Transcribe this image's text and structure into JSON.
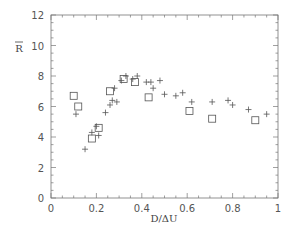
{
  "chart_data": {
    "type": "scatter",
    "title": "",
    "xlabel": "D/ΔU",
    "ylabel": "R̅",
    "xlim": [
      0,
      1
    ],
    "ylim": [
      0,
      12
    ],
    "xticks": [
      0,
      0.2,
      0.4,
      0.6,
      0.8,
      1
    ],
    "xtick_labels": [
      "0",
      "0.2",
      "0.4",
      "0.6",
      "0.8",
      "1"
    ],
    "yticks": [
      0,
      2,
      4,
      6,
      8,
      10,
      12
    ],
    "ytick_labels": [
      "0",
      "2",
      "4",
      "6",
      "8",
      "10",
      "12"
    ],
    "grid": false,
    "legend": null,
    "series": [
      {
        "name": "squares",
        "marker": "square",
        "points": [
          [
            0.1,
            6.7
          ],
          [
            0.12,
            6.0
          ],
          [
            0.18,
            3.9
          ],
          [
            0.21,
            4.6
          ],
          [
            0.26,
            7.0
          ],
          [
            0.32,
            7.8
          ],
          [
            0.37,
            7.6
          ],
          [
            0.43,
            6.6
          ],
          [
            0.61,
            5.7
          ],
          [
            0.71,
            5.2
          ],
          [
            0.9,
            5.1
          ]
        ]
      },
      {
        "name": "crosses",
        "marker": "plus",
        "points": [
          [
            0.11,
            5.5
          ],
          [
            0.15,
            3.2
          ],
          [
            0.18,
            4.3
          ],
          [
            0.2,
            4.7
          ],
          [
            0.21,
            4.1
          ],
          [
            0.24,
            5.6
          ],
          [
            0.26,
            6.1
          ],
          [
            0.27,
            6.4
          ],
          [
            0.29,
            6.3
          ],
          [
            0.28,
            7.2
          ],
          [
            0.31,
            7.7
          ],
          [
            0.33,
            8.0
          ],
          [
            0.36,
            7.8
          ],
          [
            0.38,
            8.0
          ],
          [
            0.42,
            7.6
          ],
          [
            0.44,
            7.6
          ],
          [
            0.45,
            7.2
          ],
          [
            0.48,
            7.7
          ],
          [
            0.5,
            6.8
          ],
          [
            0.55,
            6.7
          ],
          [
            0.58,
            6.9
          ],
          [
            0.62,
            6.3
          ],
          [
            0.71,
            6.3
          ],
          [
            0.78,
            6.4
          ],
          [
            0.8,
            6.1
          ],
          [
            0.87,
            5.8
          ],
          [
            0.95,
            5.5
          ]
        ]
      }
    ]
  },
  "colors": {
    "axis": "#777777",
    "marker": "#555555",
    "text": "#555555"
  }
}
